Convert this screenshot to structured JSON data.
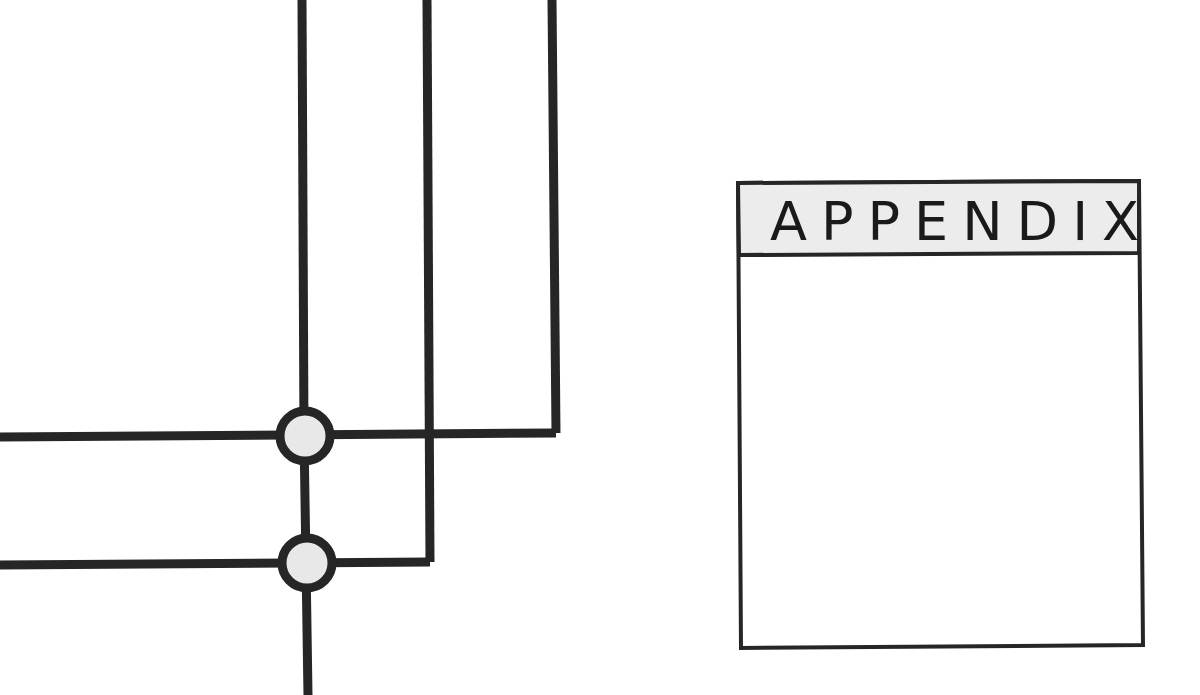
{
  "diagram": {
    "colors": {
      "line": "#262626",
      "node_fill": "#e8e8e8",
      "header_fill": "#ececec",
      "background": "#ffffff"
    },
    "wires": [
      {
        "id": "v1",
        "points": "302,0 304,436"
      },
      {
        "id": "v2",
        "points": "427,0 430,562"
      },
      {
        "id": "v3",
        "points": "552,0 556,433"
      },
      {
        "id": "h1",
        "points": "0,437 556,433"
      },
      {
        "id": "h2",
        "points": "0,565 430,562"
      },
      {
        "id": "stem-mid",
        "points": "304,436 306,563"
      },
      {
        "id": "stem-bottom",
        "points": "306,563 308,695"
      }
    ],
    "nodes": [
      {
        "id": "junction-top",
        "cx": 305,
        "cy": 436,
        "r": 25
      },
      {
        "id": "junction-bottom",
        "cx": 307,
        "cy": 563,
        "r": 25
      }
    ],
    "panel": {
      "title": "APPENDIX",
      "x": 738,
      "y": 182,
      "width": 402,
      "height": 465,
      "header_height": 72
    }
  }
}
